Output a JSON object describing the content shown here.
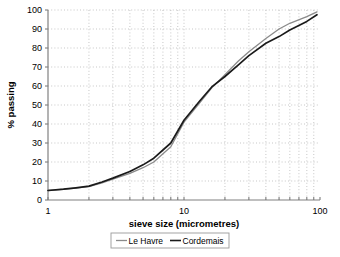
{
  "chart_data": {
    "type": "line",
    "title": "",
    "xlabel": "sieve size (micrometres)",
    "ylabel": "% passing",
    "xscale": "log",
    "xlim": [
      1,
      100
    ],
    "ylim": [
      0,
      100
    ],
    "ytick_step": 10,
    "grid": "dotted both axes",
    "legend_position": "below x-axis, boxed",
    "x_tick_labels": [
      "1",
      "10",
      "100"
    ],
    "x_tick_values": [
      1,
      10,
      100
    ],
    "y_tick_labels": [
      "0",
      "10",
      "20",
      "30",
      "40",
      "50",
      "60",
      "70",
      "80",
      "90",
      "100"
    ],
    "y_tick_values": [
      0,
      10,
      20,
      30,
      40,
      50,
      60,
      70,
      80,
      90,
      100
    ],
    "x": [
      1,
      1.3,
      1.6,
      2,
      2.5,
      3,
      4,
      5,
      6,
      8,
      10,
      13,
      16,
      20,
      25,
      30,
      40,
      50,
      60,
      80,
      95
    ],
    "series": [
      {
        "name": "Le Havre",
        "color": "#8a8a8a",
        "values": [
          5,
          5.6,
          6.2,
          7,
          9,
          11,
          14,
          17,
          20,
          28,
          41,
          51,
          59,
          66,
          73,
          78,
          85,
          90,
          93,
          96.5,
          99
        ]
      },
      {
        "name": "Cordemais",
        "color": "#1a1a1a",
        "values": [
          5,
          5.7,
          6.4,
          7.3,
          9.5,
          11.5,
          15,
          18.5,
          22,
          30,
          42,
          52,
          59.5,
          65,
          71,
          76,
          82.5,
          86,
          89.5,
          94,
          97.5
        ]
      }
    ]
  },
  "legend": {
    "items": [
      {
        "label": "Le Havre",
        "color": "#8a8a8a"
      },
      {
        "label": "Cordemais",
        "color": "#1a1a1a"
      }
    ]
  },
  "axes": {
    "x_title": "sieve size (micrometres)",
    "y_title": "% passing"
  }
}
